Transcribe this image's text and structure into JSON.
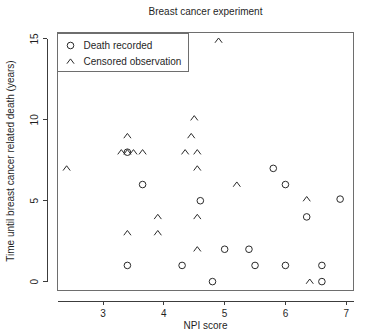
{
  "chart_data": {
    "type": "scatter",
    "title": "Breast cancer experiment",
    "xlabel": "NPI score",
    "ylabel": "Time until breast cancer related death (years)",
    "xlim": [
      2.25,
      7.12
    ],
    "ylim": [
      -0.55,
      15.4
    ],
    "xticks": [
      3,
      4,
      5,
      6,
      7
    ],
    "xtick_labels": [
      "3",
      "4",
      "5",
      "6",
      "7"
    ],
    "yticks": [
      0,
      5,
      10,
      15
    ],
    "ytick_labels": [
      "0",
      "5",
      "10",
      "15"
    ],
    "grid": false,
    "legend_position": "top-left",
    "series": [
      {
        "name": "Death recorded",
        "marker": "circle",
        "points": [
          [
            3.65,
            6.0
          ],
          [
            3.4,
            1.0
          ],
          [
            4.3,
            1.0
          ],
          [
            4.6,
            5.0
          ],
          [
            4.8,
            0.0
          ],
          [
            5.0,
            2.0
          ],
          [
            5.4,
            2.0
          ],
          [
            5.5,
            1.0
          ],
          [
            5.8,
            7.0
          ],
          [
            6.0,
            1.0
          ],
          [
            6.0,
            6.0
          ],
          [
            6.35,
            4.0
          ],
          [
            6.6,
            1.0
          ],
          [
            6.6,
            0.0
          ],
          [
            6.9,
            5.1
          ],
          [
            3.4,
            8.0
          ]
        ]
      },
      {
        "name": "Censored observation",
        "marker": "caret",
        "points": [
          [
            2.4,
            7.0
          ],
          [
            3.3,
            8.0
          ],
          [
            3.4,
            8.0
          ],
          [
            3.5,
            8.0
          ],
          [
            3.4,
            9.0
          ],
          [
            3.65,
            8.0
          ],
          [
            3.4,
            3.0
          ],
          [
            3.9,
            4.0
          ],
          [
            3.9,
            3.0
          ],
          [
            4.35,
            8.0
          ],
          [
            4.45,
            9.0
          ],
          [
            4.5,
            10.1
          ],
          [
            4.55,
            8.0
          ],
          [
            4.55,
            7.0
          ],
          [
            4.55,
            4.0
          ],
          [
            4.55,
            2.0
          ],
          [
            4.9,
            14.9
          ],
          [
            5.2,
            6.0
          ],
          [
            6.35,
            5.1
          ],
          [
            6.4,
            0.0
          ]
        ]
      }
    ]
  },
  "legend": {
    "items": [
      {
        "marker": "circle",
        "label": "Death recorded"
      },
      {
        "marker": "caret",
        "label": "Censored observation"
      }
    ]
  }
}
